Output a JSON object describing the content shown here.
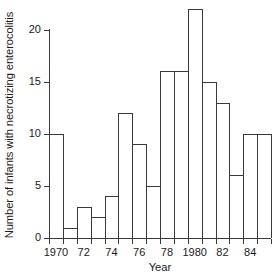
{
  "chart_data": {
    "type": "bar",
    "title": "",
    "xlabel": "Year",
    "ylabel": "Number of infants with necrotizing enterocolitis",
    "categories": [
      "1970",
      "1971",
      "1972",
      "1973",
      "1974",
      "1975",
      "1976",
      "1977",
      "1978",
      "1979",
      "1980",
      "1981",
      "1982",
      "1983",
      "1984",
      "1985"
    ],
    "values": [
      10,
      1,
      3,
      2,
      4,
      12,
      9,
      5,
      16,
      16,
      22,
      15,
      13,
      6,
      10,
      10
    ],
    "xtick_labels": [
      "1970",
      "72",
      "74",
      "76",
      "78",
      "1980",
      "82",
      "84"
    ],
    "xtick_categories": [
      "1970",
      "1972",
      "1974",
      "1976",
      "1978",
      "1980",
      "1982",
      "1984"
    ],
    "ytick_labels": [
      "0",
      "5",
      "10",
      "15",
      "20"
    ],
    "ytick_values": [
      0,
      5,
      10,
      15,
      20
    ],
    "ylim": [
      0,
      22.5
    ],
    "grid": false,
    "legend": "none",
    "bar_fill_color": "#ffffff",
    "bar_edge_color": "#3a3a3a",
    "axis_color": "#3a3a3a",
    "background_color": "#ffffff"
  }
}
